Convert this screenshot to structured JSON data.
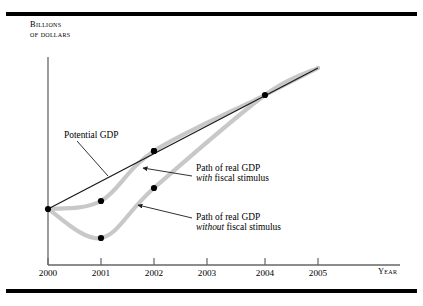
{
  "figure": {
    "background": "#ffffff",
    "rule_color": "#000000"
  },
  "axes": {
    "y_title_line1": "Billions",
    "y_title_line2": "of dollars",
    "x_title": "Year",
    "axis_color": "#555555"
  },
  "annotations": {
    "potential_gdp": "Potential GDP",
    "with_stimulus_line1": "Path of real GDP",
    "with_stimulus_italic": "with",
    "with_stimulus_rest": " fiscal stimulus",
    "without_stimulus_line1": "Path of real GDP",
    "without_stimulus_italic": "without",
    "without_stimulus_rest": " fiscal stimulus"
  },
  "chart_data": {
    "type": "line",
    "title": "",
    "xlabel": "Year",
    "ylabel": "Billions of dollars",
    "grid": false,
    "legend": "annotated-callouts",
    "categories": [
      "2000",
      "2001",
      "2002",
      "2003",
      "2004",
      "2005"
    ],
    "x_tick_px": [
      48,
      101,
      154,
      207,
      265,
      318
    ],
    "axis_ranges": {
      "x_px": [
        48,
        400
      ],
      "y_px": [
        57,
        265
      ],
      "note": "values are unlabeled on the y-axis; positions read from pixels"
    },
    "series": [
      {
        "name": "Potential GDP",
        "type": "line",
        "color": "#1a1a1a",
        "width": 1.3,
        "points_px": [
          [
            48,
            209
          ],
          [
            318,
            68
          ]
        ],
        "markers_px": [
          [
            48,
            209
          ],
          [
            154,
            151
          ],
          [
            265,
            95
          ]
        ]
      },
      {
        "name": "Path of real GDP with fiscal stimulus",
        "type": "curve",
        "color": "#c8c8c8",
        "width": 4.2,
        "points_px": [
          [
            48,
            209
          ],
          [
            101,
            201
          ],
          [
            154,
            151
          ],
          [
            265,
            95
          ],
          [
            318,
            68
          ]
        ],
        "markers_px": [
          [
            101,
            201
          ],
          [
            154,
            151
          ]
        ]
      },
      {
        "name": "Path of real GDP without fiscal stimulus",
        "type": "curve",
        "color": "#c8c8c8",
        "width": 4.2,
        "points_px": [
          [
            48,
            209
          ],
          [
            101,
            238
          ],
          [
            154,
            188
          ],
          [
            265,
            95
          ],
          [
            318,
            68
          ]
        ],
        "markers_px": [
          [
            101,
            238
          ],
          [
            154,
            188
          ]
        ]
      }
    ],
    "leader_lines_px": [
      {
        "name": "potential-gdp-leader",
        "from": [
          77,
          141
        ],
        "to": [
          108,
          176
        ],
        "arrow": false
      },
      {
        "name": "with-stimulus-leader",
        "from": [
          192,
          176
        ],
        "to": [
          143,
          168
        ],
        "arrow": true
      },
      {
        "name": "without-stimulus-leader",
        "from": [
          192,
          218
        ],
        "to": [
          138,
          205
        ],
        "arrow": true
      }
    ]
  }
}
